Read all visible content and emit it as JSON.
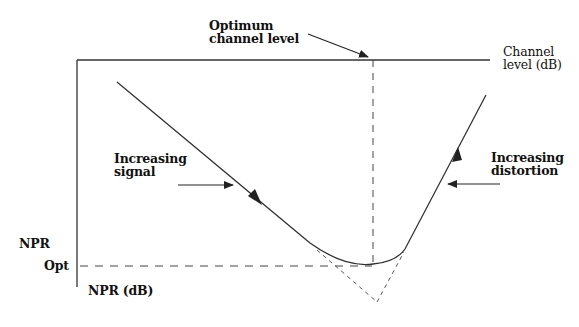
{
  "diagram": {
    "type": "npr-vs-channel-level",
    "labels": {
      "optimum_line1": "Optimum",
      "optimum_line2": "channel level",
      "x_axis_line1": "Channel",
      "x_axis_line2": "level (dB)",
      "signal_line1": "Increasing",
      "signal_line2": "signal",
      "distortion_line1": "Increasing",
      "distortion_line2": "distortion",
      "npr_opt_line1": "NPR",
      "npr_opt_line2": "Opt",
      "y_axis": "NPR (dB)"
    },
    "colors": {
      "line": "#333333",
      "text": "#111111",
      "background": "#ffffff"
    }
  }
}
